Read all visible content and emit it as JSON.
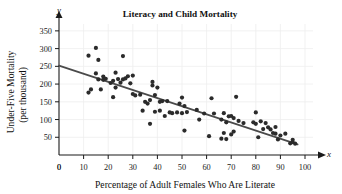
{
  "chart_data": {
    "type": "scatter",
    "title": "Literacy and Child Mortality",
    "xlabel": "Percentage of Adult Females Who Are Literate",
    "ylabel_line1": "Under-Five Mortality",
    "ylabel_line2": "(per thousand)",
    "x_axis_letter": "x",
    "y_axis_letter": "y",
    "xlim": [
      0,
      100
    ],
    "ylim": [
      0,
      375
    ],
    "xticks": [
      0,
      10,
      20,
      30,
      40,
      50,
      60,
      70,
      80,
      90,
      100
    ],
    "yticks": [
      50,
      100,
      150,
      200,
      250,
      300,
      350
    ],
    "grid": true,
    "legend": "none",
    "point_color": "#2b2b2b",
    "trend_color": "#4a4a4a",
    "grid_color": "#ededed",
    "axis_color": "#1a1a1a",
    "trend_line": {
      "label": "least-squares regression line",
      "x_start": 0,
      "y_start": 252,
      "x_end": 97,
      "y_end": 30
    },
    "points": [
      [
        12,
        280
      ],
      [
        12,
        176
      ],
      [
        13,
        185
      ],
      [
        15,
        302
      ],
      [
        15,
        230
      ],
      [
        16,
        268
      ],
      [
        16,
        213
      ],
      [
        17,
        185
      ],
      [
        18,
        221
      ],
      [
        18,
        212
      ],
      [
        19,
        215
      ],
      [
        21,
        203
      ],
      [
        22,
        163
      ],
      [
        22,
        209
      ],
      [
        23,
        232
      ],
      [
        23,
        190
      ],
      [
        24,
        214
      ],
      [
        25,
        204
      ],
      [
        26,
        279
      ],
      [
        26,
        213
      ],
      [
        27,
        216
      ],
      [
        28,
        222
      ],
      [
        29,
        202
      ],
      [
        30,
        224
      ],
      [
        30,
        172
      ],
      [
        31,
        168
      ],
      [
        33,
        170
      ],
      [
        34,
        125
      ],
      [
        35,
        150
      ],
      [
        36,
        145
      ],
      [
        37,
        155
      ],
      [
        37,
        88
      ],
      [
        38,
        206
      ],
      [
        38,
        196
      ],
      [
        39,
        122
      ],
      [
        39,
        169
      ],
      [
        40,
        190
      ],
      [
        41,
        150
      ],
      [
        41,
        125
      ],
      [
        42,
        152
      ],
      [
        43,
        110
      ],
      [
        44,
        152
      ],
      [
        45,
        120
      ],
      [
        46,
        118
      ],
      [
        48,
        120
      ],
      [
        49,
        145
      ],
      [
        50,
        162
      ],
      [
        50,
        118
      ],
      [
        51,
        138
      ],
      [
        51,
        69
      ],
      [
        52,
        121
      ],
      [
        56,
        127
      ],
      [
        57,
        100
      ],
      [
        59,
        117
      ],
      [
        61,
        53
      ],
      [
        62,
        160
      ],
      [
        63,
        117
      ],
      [
        66,
        100
      ],
      [
        66,
        46
      ],
      [
        67,
        62
      ],
      [
        67,
        118
      ],
      [
        68,
        45
      ],
      [
        68,
        92
      ],
      [
        69,
        109
      ],
      [
        70,
        110
      ],
      [
        70,
        58
      ],
      [
        71,
        104
      ],
      [
        71,
        66
      ],
      [
        72,
        164
      ],
      [
        73,
        96
      ],
      [
        75,
        90
      ],
      [
        79,
        92
      ],
      [
        80,
        120
      ],
      [
        80,
        88
      ],
      [
        81,
        50
      ],
      [
        82,
        95
      ],
      [
        83,
        73
      ],
      [
        84,
        90
      ],
      [
        85,
        78
      ],
      [
        86,
        72
      ],
      [
        87,
        62
      ],
      [
        88,
        79
      ],
      [
        88,
        60
      ],
      [
        89,
        44
      ],
      [
        90,
        55
      ],
      [
        92,
        60
      ],
      [
        94,
        33
      ],
      [
        95,
        36
      ],
      [
        95,
        43
      ],
      [
        96,
        32
      ]
    ]
  }
}
